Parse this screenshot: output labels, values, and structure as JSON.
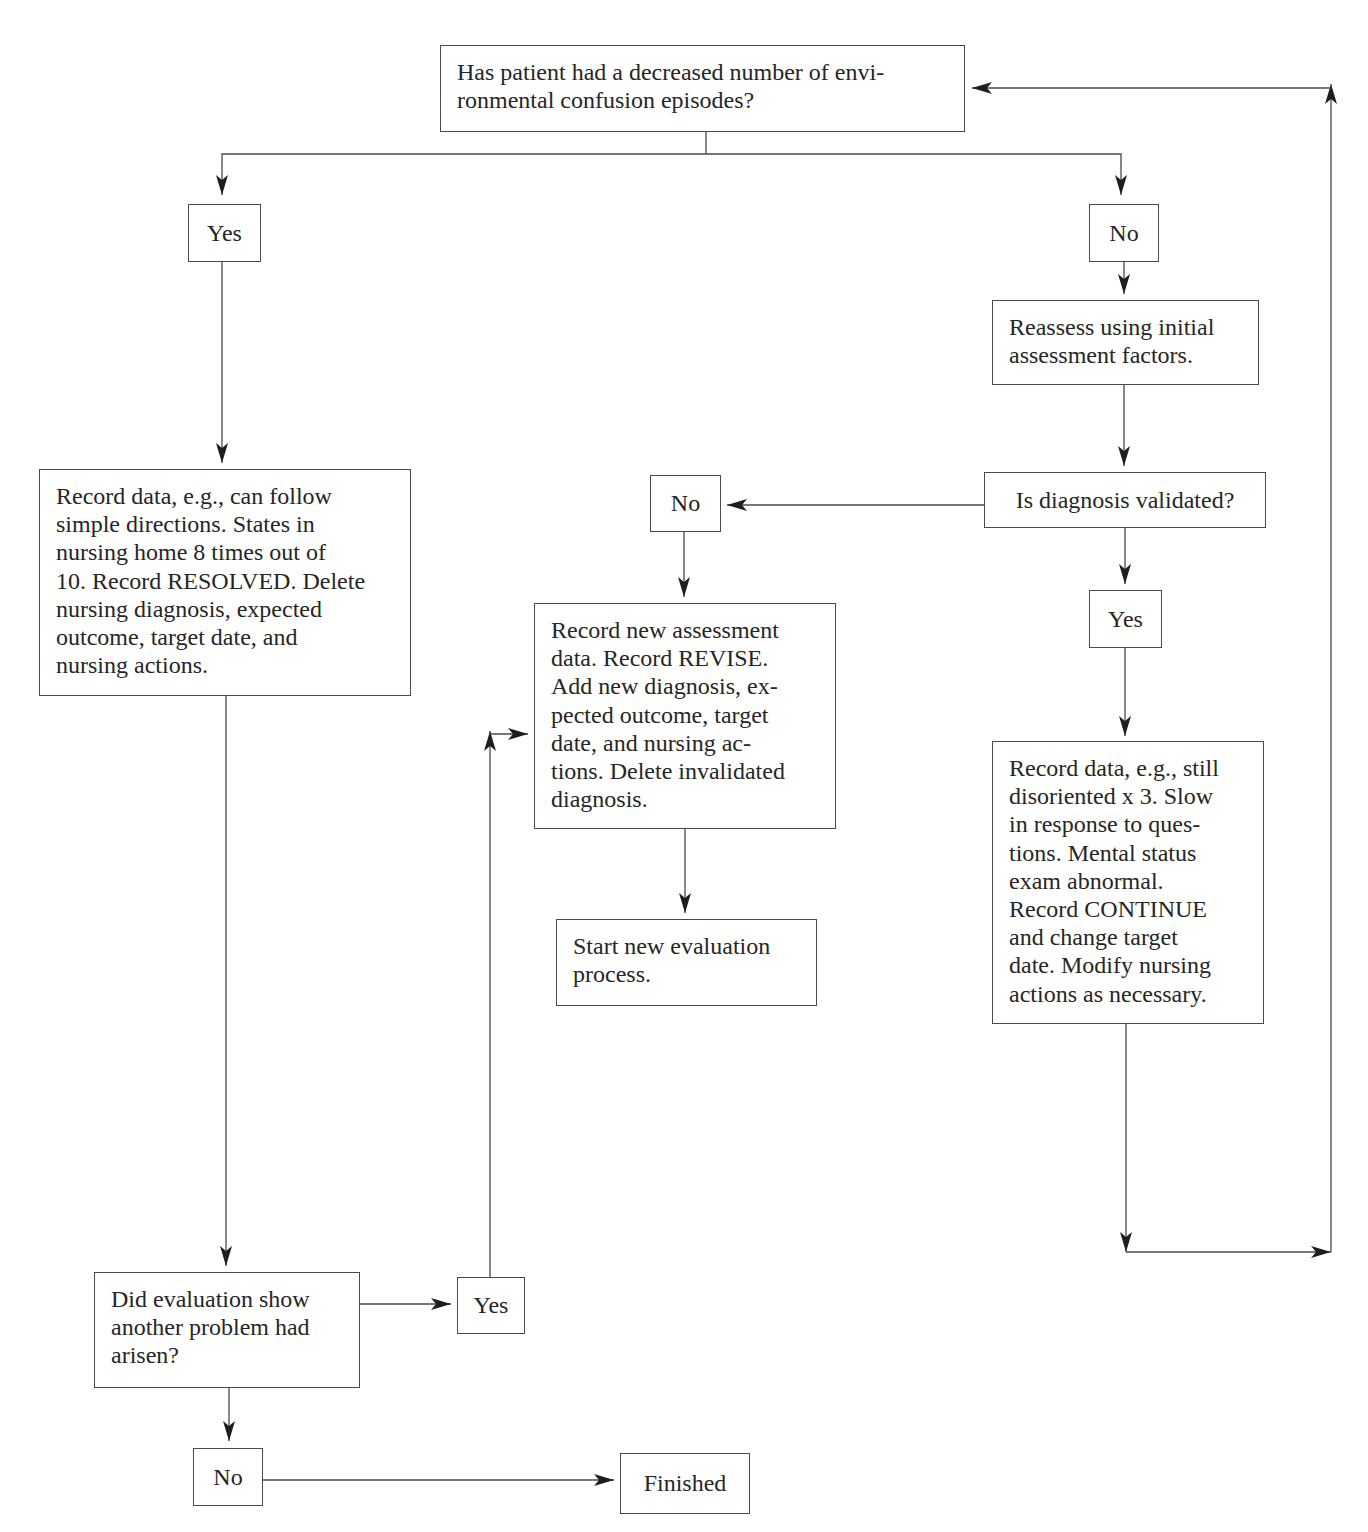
{
  "diagram": {
    "type": "flowchart",
    "colors": {
      "line": "#4a4a4a",
      "text": "#262626",
      "background": "#ffffff"
    },
    "nodes": {
      "q_decreased_confusion": {
        "label": "Has patient had a decreased number of environmental confusion episodes?",
        "lines": [
          "Has patient had a decreased number of envi-",
          "ronmental confusion episodes?"
        ]
      },
      "yes_1": {
        "label": "Yes"
      },
      "no_1": {
        "label": "No"
      },
      "reassess": {
        "label": "Reassess using initial assessment factors.",
        "lines": [
          "Reassess using initial",
          "assessment factors."
        ]
      },
      "record_resolved": {
        "label": "Record data, e.g., can follow simple directions. States in nursing home 8 times out of 10. Record RESOLVED. Delete nursing diagnosis, expected outcome, target date, and nursing actions.",
        "lines": [
          "Record data, e.g., can follow",
          "simple directions. States in",
          "nursing home 8 times out of",
          "10. Record RESOLVED. Delete",
          "nursing diagnosis, expected",
          "outcome, target date, and",
          "nursing actions."
        ]
      },
      "no_2": {
        "label": "No"
      },
      "q_diagnosis_validated": {
        "label": "Is diagnosis validated?"
      },
      "yes_2": {
        "label": "Yes"
      },
      "record_revise": {
        "label": "Record new assessment data. Record REVISE. Add new diagnosis, expected outcome, target date, and nursing actions. Delete invalidated diagnosis.",
        "lines": [
          "Record new assessment",
          "data. Record REVISE.",
          "Add new diagnosis, ex-",
          "pected outcome, target",
          "date, and nursing ac-",
          "tions. Delete invalidated",
          "diagnosis."
        ]
      },
      "record_continue": {
        "label": "Record data, e.g., still disoriented x 3. Slow in response to questions. Mental status exam abnormal. Record CONTINUE and change target date. Modify nursing actions as necessary.",
        "lines": [
          "Record data, e.g., still",
          "disoriented x 3. Slow",
          "in response to ques-",
          "tions. Mental status",
          "exam abnormal.",
          "Record CONTINUE",
          "and change target",
          "date. Modify nursing",
          "actions as necessary."
        ]
      },
      "start_new_evaluation": {
        "label": "Start new evaluation process.",
        "lines": [
          "Start new evaluation",
          "process."
        ]
      },
      "q_another_problem": {
        "label": "Did evaluation show another problem had arisen?",
        "lines": [
          "Did evaluation show",
          "another problem had",
          "arisen?"
        ]
      },
      "yes_3": {
        "label": "Yes"
      },
      "no_3": {
        "label": "No"
      },
      "finished": {
        "label": "Finished"
      }
    },
    "edges": [
      {
        "from": "q_decreased_confusion",
        "to": "yes_1"
      },
      {
        "from": "q_decreased_confusion",
        "to": "no_1"
      },
      {
        "from": "no_1",
        "to": "reassess"
      },
      {
        "from": "reassess",
        "to": "q_diagnosis_validated"
      },
      {
        "from": "q_diagnosis_validated",
        "to": "no_2"
      },
      {
        "from": "q_diagnosis_validated",
        "to": "yes_2"
      },
      {
        "from": "yes_2",
        "to": "record_continue"
      },
      {
        "from": "record_continue",
        "to": "q_decreased_confusion",
        "note": "loop back via right edge"
      },
      {
        "from": "no_2",
        "to": "record_revise"
      },
      {
        "from": "record_revise",
        "to": "start_new_evaluation"
      },
      {
        "from": "yes_1",
        "to": "record_resolved"
      },
      {
        "from": "record_resolved",
        "to": "q_another_problem"
      },
      {
        "from": "q_another_problem",
        "to": "yes_3"
      },
      {
        "from": "yes_3",
        "to": "record_revise"
      },
      {
        "from": "q_another_problem",
        "to": "no_3"
      },
      {
        "from": "no_3",
        "to": "finished"
      }
    ]
  }
}
